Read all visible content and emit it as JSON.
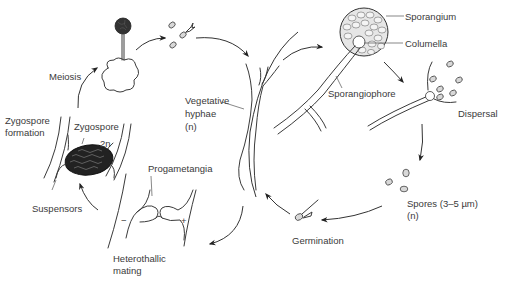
{
  "diagram": {
    "type": "life-cycle",
    "colors": {
      "line": "#3a3a3a",
      "spore_fill": "#d8d8d8",
      "zygospore_fill": "#222222",
      "background": "#ffffff"
    },
    "labels": {
      "sporangium": "Sporangium",
      "columella": "Columella",
      "sporangiophore": "Sporangiophore",
      "dispersal": "Dispersal",
      "spores_line1": "Spores (3–5 µm)",
      "spores_line2": "(n)",
      "germination": "Germination",
      "vegetative_line1": "Vegetative",
      "vegetative_line2": "hyphae",
      "vegetative_line3": "(n)",
      "progametangia": "Progametangia",
      "minus_sign": "−",
      "plus_sign": "+",
      "heterothallic_line1": "Heterothallic",
      "heterothallic_line2": "mating",
      "suspensors": "Suspensors",
      "zygospore_formation_line1": "Zygospore",
      "zygospore_formation_line2": "formation",
      "zygospore": "Zygospore",
      "ploidy_2n": "2n",
      "meiosis": "Meiosis"
    },
    "stages": [
      "Sporangium with Columella on Sporangiophore",
      "Dispersal",
      "Spores (3–5 µm) (n)",
      "Germination",
      "Vegetative hyphae (n)",
      "Heterothallic mating (Progametangia −/+)",
      "Zygospore formation (Zygospore 2n, Suspensors)",
      "Meiosis",
      "Spores released"
    ]
  }
}
